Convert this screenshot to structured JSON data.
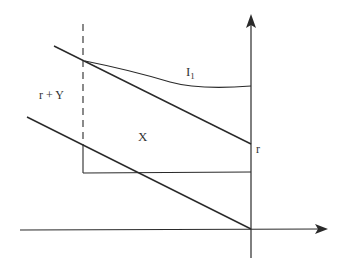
{
  "diagram": {
    "labels": {
      "indifference_curve": "I",
      "indifference_curve_sub": "1",
      "left_region": "r + Y",
      "center_region": "X",
      "axis_point": "r"
    },
    "colors": {
      "line": "#2a2a2a",
      "background": "#ffffff"
    }
  }
}
